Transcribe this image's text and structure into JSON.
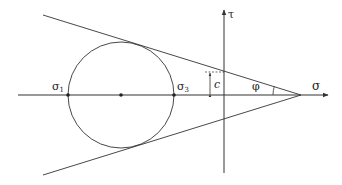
{
  "diagram": {
    "type": "mohr-coulomb",
    "colors": {
      "stroke": "#333333",
      "background": "#ffffff"
    },
    "axes": {
      "horizontal_label": "σ",
      "vertical_label": "τ"
    },
    "circle": {
      "left_point_label": "σ",
      "left_point_sub": "1",
      "right_point_label": "σ",
      "right_point_sub": "3"
    },
    "cohesion_label": "c",
    "friction_angle_label": "φ"
  }
}
